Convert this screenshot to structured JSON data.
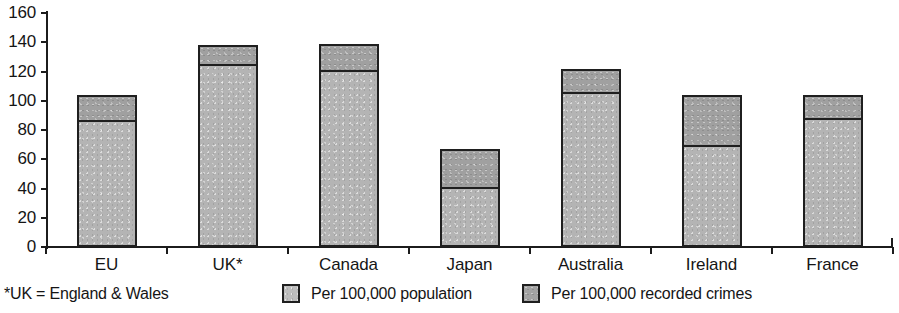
{
  "chart_data": {
    "type": "bar",
    "title": "",
    "subtitle": "",
    "xlabel": "",
    "ylabel": "",
    "stacked": true,
    "grid": false,
    "legend_position": "bottom",
    "ylim": [
      0,
      160
    ],
    "y_ticks": [
      0,
      20,
      40,
      60,
      80,
      100,
      120,
      140,
      160
    ],
    "categories": [
      "EU",
      "UK*",
      "Canada",
      "Japan",
      "Australia",
      "Ireland",
      "France"
    ],
    "series": [
      {
        "name": "Per 100,000 population",
        "color": "#b4b4b4",
        "values": [
          87,
          125,
          121,
          41,
          106,
          70,
          88
        ]
      },
      {
        "name": "Per 100,000 recorded crimes",
        "color": "#a0a0a0",
        "values": [
          17,
          13,
          18,
          26,
          16,
          34,
          16
        ]
      }
    ],
    "totals": [
      104,
      138,
      139,
      67,
      122,
      104,
      104
    ],
    "annotations": [
      "*UK = England & Wales"
    ]
  },
  "axes": {
    "y_tick_labels": [
      "160",
      "140",
      "120",
      "100",
      "80",
      "60",
      "40",
      "20",
      "0"
    ],
    "x_tick_labels": [
      "EU",
      "UK*",
      "Canada",
      "Japan",
      "Australia",
      "Ireland",
      "France"
    ]
  },
  "footnote": {
    "text": "*UK = England & Wales"
  },
  "legend": {
    "items": [
      {
        "label": "Per 100,000 population",
        "swatch": "light-gray-swatch"
      },
      {
        "label": "Per 100,000 recorded crimes",
        "swatch": "dark-gray-swatch"
      }
    ]
  }
}
